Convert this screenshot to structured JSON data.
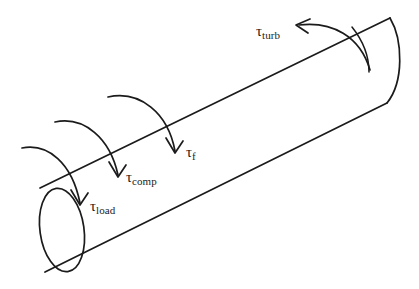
{
  "figure": {
    "type": "free-body-diagram",
    "background_color": "#ffffff",
    "stroke_color": "#1b1b1b"
  },
  "shaft": {
    "name": "cylindrical shaft",
    "orientation": "isometric, axis running from lower-left to upper-right",
    "left_end": {
      "name": "load end cap",
      "shape": "full ellipse",
      "center_x": 62,
      "center_y": 230,
      "radius_x": 22,
      "radius_y": 42,
      "rotation_deg": -8
    },
    "right_end": {
      "name": "turbine end cap",
      "shape": "partial arc (far side only)",
      "top_x": 390,
      "top_y": 18,
      "bottom_x": 387,
      "bottom_y": 103
    },
    "top_edge": {
      "x1": 40,
      "y1": 188,
      "x2": 390,
      "y2": 18
    },
    "bottom_edge": {
      "x1": 45,
      "y1": 272,
      "x2": 387,
      "y2": 103
    }
  },
  "torques": [
    {
      "id": "load",
      "symbol": "τ",
      "subscript": "load",
      "label_text": "τload",
      "meaning": "load torque",
      "arrow_direction": "over-the-top, arrowhead pointing down-right",
      "position_on_shaft": "nearest left (load) end",
      "label_x": 90,
      "label_y": 199
    },
    {
      "id": "comp",
      "symbol": "τ",
      "subscript": "comp",
      "label_text": "τcomp",
      "meaning": "compressor torque",
      "arrow_direction": "over-the-top, arrowhead pointing down-right",
      "position_on_shaft": "second from left",
      "label_x": 126,
      "label_y": 170
    },
    {
      "id": "f",
      "symbol": "τ",
      "subscript": "f",
      "label_text": "τf",
      "meaning": "friction torque",
      "arrow_direction": "over-the-top, arrowhead pointing down-right",
      "position_on_shaft": "middle of shaft",
      "label_x": 186,
      "label_y": 145
    },
    {
      "id": "turb",
      "symbol": "τ",
      "subscript": "turb",
      "label_text": "τturb",
      "meaning": "turbine torque",
      "arrow_direction": "over-the-top, arrowhead pointing left (opposite sense)",
      "position_on_shaft": "near right (turbine) end",
      "label_x": 256,
      "label_y": 24
    }
  ]
}
